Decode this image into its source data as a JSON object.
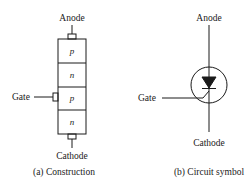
{
  "construction": {
    "anode_label": "Anode",
    "cathode_label": "Cathode",
    "gate_label": "Gate",
    "layers": [
      "p",
      "n",
      "p",
      "n"
    ],
    "caption": "(a) Construction"
  },
  "symbol": {
    "anode_label": "Anode",
    "cathode_label": "Cathode",
    "gate_label": "Gate",
    "caption": "(b) Circuit symbol"
  },
  "colors": {
    "stroke": "#1a1a1a",
    "background": "#ffffff"
  }
}
